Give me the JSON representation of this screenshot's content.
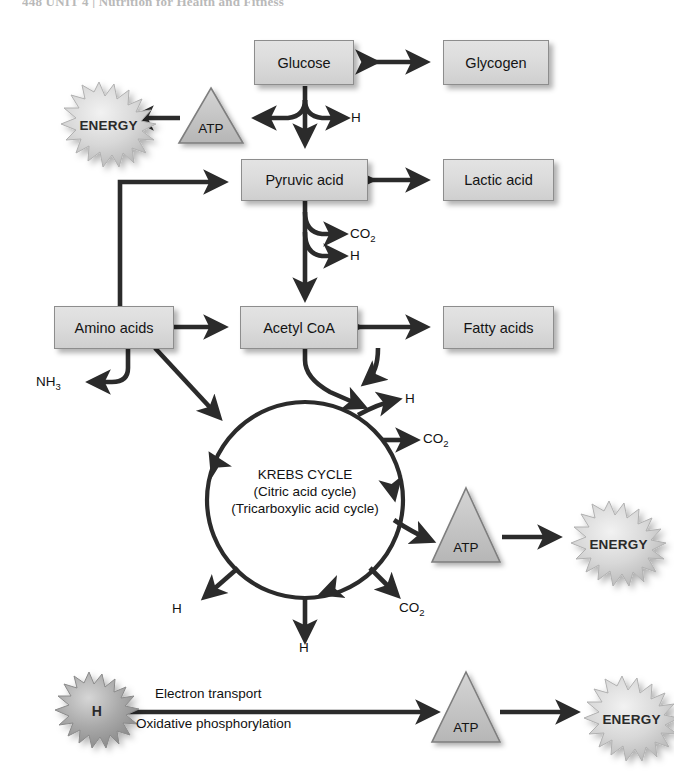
{
  "header": {
    "text": "448   UNIT 4  |  Nutrition for Health and Fitness"
  },
  "diagram": {
    "boxes": [
      {
        "id": "glucose",
        "label": "Glucose"
      },
      {
        "id": "glycogen",
        "label": "Glycogen"
      },
      {
        "id": "pyruvic",
        "label": "Pyruvic acid"
      },
      {
        "id": "lactic",
        "label": "Lactic acid"
      },
      {
        "id": "amino",
        "label": "Amino acids"
      },
      {
        "id": "acetyl",
        "label": "Acetyl CoA"
      },
      {
        "id": "fatty",
        "label": "Fatty acids"
      }
    ],
    "atp_nodes": [
      {
        "id": "atp-glycolysis",
        "label": "ATP"
      },
      {
        "id": "atp-krebs",
        "label": "ATP"
      },
      {
        "id": "atp-etc",
        "label": "ATP"
      }
    ],
    "energy_nodes": [
      {
        "id": "energy-glycolysis",
        "label": "ENERGY"
      },
      {
        "id": "energy-krebs",
        "label": "ENERGY"
      },
      {
        "id": "energy-etc",
        "label": "ENERGY"
      }
    ],
    "hydrogen_burst": {
      "id": "h-burst",
      "label": "H"
    },
    "cycle": {
      "line1": "KREBS CYCLE",
      "line2": "(Citric acid cycle)",
      "line3": "(Tricarboxylic acid cycle)"
    },
    "byproducts": [
      {
        "id": "h-glycolysis",
        "label": "H"
      },
      {
        "id": "co2-pyruvate",
        "label": "CO2"
      },
      {
        "id": "h-pyruvate",
        "label": "H"
      },
      {
        "id": "nh3-amino",
        "label": "NH3"
      },
      {
        "id": "h-krebs-upper",
        "label": "H"
      },
      {
        "id": "co2-krebs-upper",
        "label": "CO2"
      },
      {
        "id": "h-krebs-left",
        "label": "H"
      },
      {
        "id": "h-krebs-bottom",
        "label": "H"
      },
      {
        "id": "co2-krebs-lower",
        "label": "CO2"
      }
    ],
    "etc_labels": {
      "line1": "Electron transport",
      "line2": "Oxidative phosphorylation"
    }
  },
  "colors": {
    "box_fill": "#dcdcdc",
    "box_border": "#8d8d8d",
    "arrow": "#2b2b2b",
    "burst_light": "#cfcfcf",
    "burst_dark": "#9a9a9a",
    "triangle_fill": "#c4c4c4",
    "text": "#111111"
  }
}
